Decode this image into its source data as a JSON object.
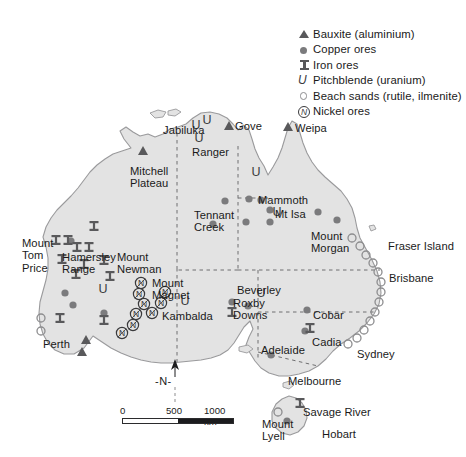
{
  "map": {
    "title": "Mineral resources of Australia",
    "land_color": "#e3e3e3",
    "coast_color": "#9a9a9c",
    "border_color": "#6e6e70",
    "symbol_dark": "#59595b",
    "symbol_mid": "#7b7b7d",
    "symbol_light": "#8d8d8f"
  },
  "legend": {
    "items": [
      {
        "symbol": "triangle-filled",
        "icon_name": "bauxite-triangle-icon",
        "label": "Bauxite (aluminium)"
      },
      {
        "symbol": "circle-filled",
        "icon_name": "copper-circle-icon",
        "label": "Copper ores"
      },
      {
        "symbol": "iron-bar",
        "icon_name": "iron-ibeam-icon",
        "label": "Iron ores"
      },
      {
        "symbol": "letter-u",
        "icon_name": "pitchblende-u-icon",
        "label": "Pitchblende (uranium)"
      },
      {
        "symbol": "circle-open",
        "icon_name": "beach-sand-circle-icon",
        "label": "Beach sands (rutile, ilmenite)"
      },
      {
        "symbol": "circled-n",
        "icon_name": "nickel-circled-n-icon",
        "label": "Nickel ores"
      }
    ]
  },
  "labels": [
    {
      "name": "label-jabiluka",
      "text": "Jabiluka",
      "x": 163,
      "y": 124,
      "align": "left"
    },
    {
      "name": "label-gove",
      "text": "Gove",
      "x": 235,
      "y": 120,
      "align": "left"
    },
    {
      "name": "label-weipa",
      "text": "Weipa",
      "x": 295,
      "y": 122,
      "align": "left"
    },
    {
      "name": "label-ranger",
      "text": "Ranger",
      "x": 192,
      "y": 146,
      "align": "left"
    },
    {
      "name": "label-mitchell-plateau",
      "text": "Mitchell\nPlateau",
      "x": 130,
      "y": 165,
      "align": "left"
    },
    {
      "name": "label-mammoth",
      "text": "Mammoth",
      "x": 258,
      "y": 194,
      "align": "left"
    },
    {
      "name": "label-mt-isa",
      "text": "Mt Isa",
      "x": 275,
      "y": 208,
      "align": "left"
    },
    {
      "name": "label-tennant-creek",
      "text": "Tennant\nCreek",
      "x": 194,
      "y": 209,
      "align": "left"
    },
    {
      "name": "label-mount-morgan",
      "text": "Mount\nMorgan",
      "x": 311,
      "y": 230,
      "align": "left"
    },
    {
      "name": "label-fraser-island",
      "text": "Fraser Island",
      "x": 388,
      "y": 240,
      "align": "left"
    },
    {
      "name": "label-brisbane",
      "text": "Brisbane",
      "x": 389,
      "y": 272,
      "align": "left"
    },
    {
      "name": "label-mount-tom-price",
      "text": "Mount\nTom\nPrice",
      "x": 22,
      "y": 237,
      "align": "left"
    },
    {
      "name": "label-hamersley-range",
      "text": "Hamersley\nRange",
      "x": 62,
      "y": 251,
      "align": "left"
    },
    {
      "name": "label-mount-newman",
      "text": "Mount\nNewman",
      "x": 117,
      "y": 251,
      "align": "left"
    },
    {
      "name": "label-mount-magnet",
      "text": "Mount\nMagnet",
      "x": 152,
      "y": 277,
      "align": "left"
    },
    {
      "name": "label-kambalda",
      "text": "Kambalda",
      "x": 162,
      "y": 310,
      "align": "left"
    },
    {
      "name": "label-beverley",
      "text": "Beverley",
      "x": 237,
      "y": 284,
      "align": "left"
    },
    {
      "name": "label-roxby-downs",
      "text": "Roxby\nDowns",
      "x": 233,
      "y": 297,
      "align": "left"
    },
    {
      "name": "label-cobar",
      "text": "Cobar",
      "x": 313,
      "y": 309,
      "align": "left"
    },
    {
      "name": "label-adelaide",
      "text": "Adelaide",
      "x": 261,
      "y": 344,
      "align": "left"
    },
    {
      "name": "label-cadia",
      "text": "Cadia",
      "x": 312,
      "y": 336,
      "align": "left"
    },
    {
      "name": "label-sydney",
      "text": "Sydney",
      "x": 357,
      "y": 348,
      "align": "left"
    },
    {
      "name": "label-perth",
      "text": "Perth",
      "x": 43,
      "y": 338,
      "align": "left"
    },
    {
      "name": "label-melbourne",
      "text": "Melbourne",
      "x": 288,
      "y": 375,
      "align": "left"
    },
    {
      "name": "label-savage-river",
      "text": "Savage River",
      "x": 303,
      "y": 406,
      "align": "left"
    },
    {
      "name": "label-mount-lyell",
      "text": "Mount\nLyell",
      "x": 262,
      "y": 418,
      "align": "left"
    },
    {
      "name": "label-hobart",
      "text": "Hobart",
      "x": 322,
      "y": 428,
      "align": "left"
    }
  ],
  "north_arrow": {
    "label": "-N-"
  },
  "scale_bar": {
    "ticks": [
      "0",
      "500",
      "1000 km"
    ],
    "unit": "km",
    "max_value": 1000
  },
  "symbols": {
    "bauxite": [
      {
        "x": 229,
        "y": 126
      },
      {
        "x": 288,
        "y": 127
      },
      {
        "x": 143,
        "y": 151
      },
      {
        "x": 86,
        "y": 340
      },
      {
        "x": 82,
        "y": 352
      }
    ],
    "copper": [
      {
        "x": 261,
        "y": 200
      },
      {
        "x": 270,
        "y": 210
      },
      {
        "x": 270,
        "y": 222
      },
      {
        "x": 225,
        "y": 201
      },
      {
        "x": 213,
        "y": 224
      },
      {
        "x": 246,
        "y": 222
      },
      {
        "x": 249,
        "y": 199
      },
      {
        "x": 318,
        "y": 212
      },
      {
        "x": 337,
        "y": 220
      },
      {
        "x": 71,
        "y": 241
      },
      {
        "x": 65,
        "y": 293
      },
      {
        "x": 73,
        "y": 305
      },
      {
        "x": 104,
        "y": 313
      },
      {
        "x": 232,
        "y": 302
      },
      {
        "x": 248,
        "y": 306
      },
      {
        "x": 271,
        "y": 355
      },
      {
        "x": 307,
        "y": 310
      },
      {
        "x": 305,
        "y": 331
      },
      {
        "x": 287,
        "y": 421
      }
    ],
    "iron": [
      {
        "x": 94,
        "y": 226
      },
      {
        "x": 56,
        "y": 240
      },
      {
        "x": 68,
        "y": 240
      },
      {
        "x": 77,
        "y": 247
      },
      {
        "x": 89,
        "y": 247
      },
      {
        "x": 62,
        "y": 259
      },
      {
        "x": 84,
        "y": 264
      },
      {
        "x": 104,
        "y": 260
      },
      {
        "x": 76,
        "y": 274
      },
      {
        "x": 110,
        "y": 276
      },
      {
        "x": 60,
        "y": 318
      },
      {
        "x": 104,
        "y": 320
      },
      {
        "x": 232,
        "y": 312
      },
      {
        "x": 310,
        "y": 328
      },
      {
        "x": 300,
        "y": 403
      }
    ],
    "uranium": [
      {
        "x": 196,
        "y": 124
      },
      {
        "x": 207,
        "y": 119
      },
      {
        "x": 199,
        "y": 137
      },
      {
        "x": 256,
        "y": 171
      },
      {
        "x": 277,
        "y": 211
      },
      {
        "x": 103,
        "y": 288
      },
      {
        "x": 185,
        "y": 300
      },
      {
        "x": 261,
        "y": 292
      }
    ],
    "beach_sand": [
      {
        "x": 352,
        "y": 238
      },
      {
        "x": 360,
        "y": 246
      },
      {
        "x": 366,
        "y": 255
      },
      {
        "x": 373,
        "y": 263
      },
      {
        "x": 378,
        "y": 272
      },
      {
        "x": 381,
        "y": 282
      },
      {
        "x": 381,
        "y": 292
      },
      {
        "x": 379,
        "y": 302
      },
      {
        "x": 375,
        "y": 312
      },
      {
        "x": 370,
        "y": 321
      },
      {
        "x": 364,
        "y": 330
      },
      {
        "x": 357,
        "y": 338
      },
      {
        "x": 348,
        "y": 344
      },
      {
        "x": 41,
        "y": 318
      },
      {
        "x": 41,
        "y": 331
      },
      {
        "x": 278,
        "y": 412
      }
    ],
    "nickel": [
      {
        "x": 141,
        "y": 283
      },
      {
        "x": 139,
        "y": 294
      },
      {
        "x": 144,
        "y": 304
      },
      {
        "x": 136,
        "y": 314
      },
      {
        "x": 152,
        "y": 313
      },
      {
        "x": 133,
        "y": 325
      },
      {
        "x": 122,
        "y": 333
      },
      {
        "x": 165,
        "y": 292
      },
      {
        "x": 161,
        "y": 303
      }
    ]
  }
}
